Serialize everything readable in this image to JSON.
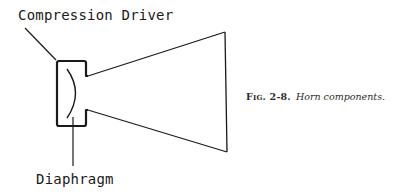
{
  "diagram": {
    "labels": {
      "compression_driver": "Compression Driver",
      "diaphragm": "Diaphragm"
    },
    "caption": {
      "figure_number": "Fig. 2-8.",
      "title": "Horn components."
    },
    "colors": {
      "line": "#1a1a1a",
      "background": "#ffffff"
    },
    "components": [
      "compression-driver",
      "diaphragm",
      "horn-throat",
      "horn-mouth"
    ]
  }
}
